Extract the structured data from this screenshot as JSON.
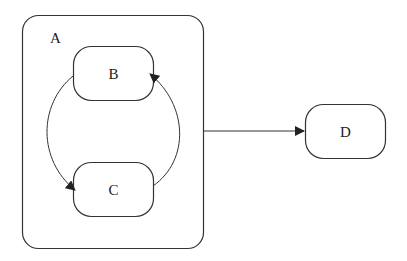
{
  "diagram": {
    "type": "statechart",
    "states": {
      "A": {
        "label": "A",
        "x": 22,
        "y": 15,
        "w": 181,
        "h": 233,
        "r": 16
      },
      "B": {
        "label": "B",
        "x": 73,
        "y": 46,
        "w": 80,
        "h": 54,
        "r": 18
      },
      "C": {
        "label": "C",
        "x": 73,
        "y": 162,
        "w": 80,
        "h": 54,
        "r": 18
      },
      "D": {
        "label": "D",
        "x": 305,
        "y": 104,
        "w": 80,
        "h": 55,
        "r": 18
      }
    },
    "transitions": [
      {
        "from": "B",
        "to": "C",
        "side": "left"
      },
      {
        "from": "C",
        "to": "B",
        "side": "right"
      },
      {
        "from": "A",
        "to": "D"
      }
    ],
    "colors": {
      "stroke": "#333333",
      "background": "#ffffff"
    }
  }
}
